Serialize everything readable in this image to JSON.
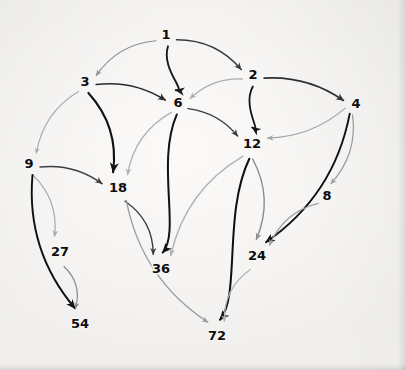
{
  "figure": {
    "kind": "directed-graph-diagram",
    "background_color": "#f4f3f1",
    "label_color": "#0d0d0d"
  },
  "graph": {
    "nodes": [
      {
        "id": "1",
        "label": "1",
        "x": 166,
        "y": 35
      },
      {
        "id": "3",
        "label": "3",
        "x": 85,
        "y": 82
      },
      {
        "id": "2",
        "label": "2",
        "x": 253,
        "y": 75
      },
      {
        "id": "6",
        "label": "6",
        "x": 178,
        "y": 103
      },
      {
        "id": "4",
        "label": "4",
        "x": 356,
        "y": 104
      },
      {
        "id": "12",
        "label": "12",
        "x": 252,
        "y": 144
      },
      {
        "id": "9",
        "label": "9",
        "x": 29,
        "y": 164
      },
      {
        "id": "18",
        "label": "18",
        "x": 118,
        "y": 188
      },
      {
        "id": "8",
        "label": "8",
        "x": 327,
        "y": 196
      },
      {
        "id": "27",
        "label": "27",
        "x": 60,
        "y": 252
      },
      {
        "id": "36",
        "label": "36",
        "x": 161,
        "y": 269
      },
      {
        "id": "24",
        "label": "24",
        "x": 257,
        "y": 256
      },
      {
        "id": "54",
        "label": "54",
        "x": 80,
        "y": 324
      },
      {
        "id": "72",
        "label": "72",
        "x": 217,
        "y": 336
      }
    ],
    "edges": [
      {
        "from": "1",
        "to": "3",
        "color": "#8f8f8f",
        "width": 1.2,
        "curve": "arc-left"
      },
      {
        "from": "1",
        "to": "6",
        "color": "#1a1a1a",
        "width": 1.9,
        "curve": "s-curve"
      },
      {
        "from": "1",
        "to": "2",
        "color": "#3a3a3a",
        "width": 1.5,
        "curve": "arc-right"
      },
      {
        "from": "3",
        "to": "6",
        "color": "#2a2a2a",
        "width": 1.6,
        "curve": "arc-down"
      },
      {
        "from": "3",
        "to": "18",
        "color": "#111111",
        "width": 2.1,
        "curve": "arc-right"
      },
      {
        "from": "3",
        "to": "9",
        "color": "#a8a8a8",
        "width": 1.1,
        "curve": "arc-left"
      },
      {
        "from": "2",
        "to": "6",
        "color": "#adadad",
        "width": 1.3,
        "curve": "arc-up"
      },
      {
        "from": "2",
        "to": "12",
        "color": "#141414",
        "width": 1.8,
        "curve": "s-curve"
      },
      {
        "from": "2",
        "to": "4",
        "color": "#2f2f2f",
        "width": 1.6,
        "curve": "arc-down"
      },
      {
        "from": "4",
        "to": "12",
        "color": "#a5a5a5",
        "width": 1.3,
        "curve": "arc-down"
      },
      {
        "from": "4",
        "to": "8",
        "color": "#9a9a9a",
        "width": 1.2,
        "curve": "arc-right"
      },
      {
        "from": "4",
        "to": "24",
        "color": "#0f0f0f",
        "width": 1.9,
        "curve": "arc-right"
      },
      {
        "from": "6",
        "to": "12",
        "color": "#3b3b3b",
        "width": 1.4,
        "curve": "arc-down"
      },
      {
        "from": "6",
        "to": "18",
        "color": "#b0b0b0",
        "width": 1.3,
        "curve": "arc-left"
      },
      {
        "from": "6",
        "to": "36",
        "color": "#121212",
        "width": 2.0,
        "curve": "s-curve"
      },
      {
        "from": "9",
        "to": "18",
        "color": "#3f3f3f",
        "width": 1.5,
        "curve": "arc-down"
      },
      {
        "from": "9",
        "to": "27",
        "color": "#ababab",
        "width": 1.3,
        "curve": "arc-right"
      },
      {
        "from": "9",
        "to": "54",
        "color": "#101010",
        "width": 1.9,
        "curve": "arc-left"
      },
      {
        "from": "12",
        "to": "36",
        "color": "#b2b2b2",
        "width": 1.4,
        "curve": "arc-left"
      },
      {
        "from": "12",
        "to": "24",
        "color": "#8c8c8c",
        "width": 1.4,
        "curve": "arc-right"
      },
      {
        "from": "12",
        "to": "72",
        "color": "#0f0f0f",
        "width": 2.0,
        "curve": "s-curve"
      },
      {
        "from": "18",
        "to": "36",
        "color": "#3c3c3c",
        "width": 1.4,
        "curve": "arc-right"
      },
      {
        "from": "18",
        "to": "72",
        "color": "#9d9d9d",
        "width": 1.3,
        "curve": "arc-left"
      },
      {
        "from": "27",
        "to": "54",
        "color": "#8a8a8a",
        "width": 1.2,
        "curve": "arc-right"
      },
      {
        "from": "8",
        "to": "24",
        "color": "#a0a0a0",
        "width": 1.3,
        "curve": "arc-left"
      },
      {
        "from": "24",
        "to": "72",
        "color": "#b4b4b4",
        "width": 1.3,
        "curve": "arc-left"
      }
    ]
  }
}
